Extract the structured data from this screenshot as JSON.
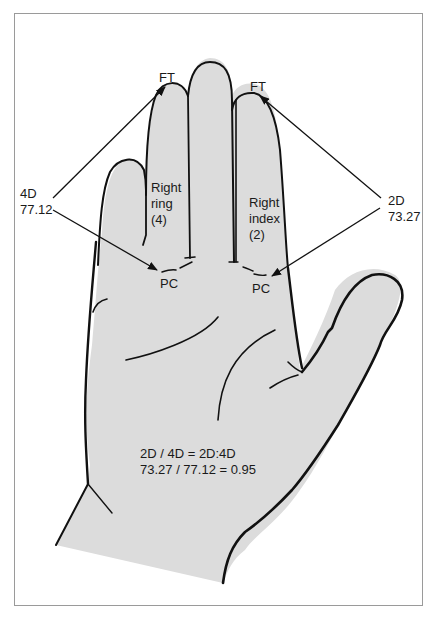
{
  "diagram": {
    "type": "anatomical-illustration",
    "colors": {
      "hand_fill": "#dcdcdc",
      "outline": "#111111",
      "frame": "#9a9a9a",
      "text": "#1a1a1a"
    },
    "landmarks": {
      "ring_tip": "FT",
      "index_tip": "FT",
      "ring_base": "PC",
      "index_base": "PC"
    },
    "fingers": {
      "ring": {
        "line1": "Right",
        "line2": "ring",
        "line3": "(4)"
      },
      "index": {
        "line1": "Right",
        "line2": "index",
        "line3": "(2)"
      }
    },
    "measurements": {
      "ring": {
        "label": "4D",
        "value": "77.12"
      },
      "index": {
        "label": "2D",
        "value": "73.27"
      }
    },
    "formula": {
      "line1": "2D / 4D = 2D:4D",
      "line2": "73.27 / 77.12 = 0.95"
    }
  }
}
